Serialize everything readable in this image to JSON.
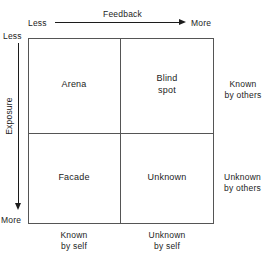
{
  "diagram": {
    "type": "johari-window",
    "grid": {
      "rows": 2,
      "columns": 2
    },
    "quadrants": [
      {
        "id": "arena",
        "label_line1": "Arena",
        "label_line2": "",
        "row": "top",
        "column": "left"
      },
      {
        "id": "blind-spot",
        "label_line1": "Blind",
        "label_line2": "spot",
        "row": "top",
        "column": "right"
      },
      {
        "id": "facade",
        "label_line1": "Facade",
        "label_line2": "",
        "row": "bottom",
        "column": "left"
      },
      {
        "id": "unknown",
        "label_line1": "Unknown",
        "label_line2": "",
        "row": "bottom",
        "column": "right"
      }
    ],
    "horizontal_axis": {
      "title": "Feedback",
      "start_label": "Less",
      "end_label": "More",
      "direction": "left-to-right"
    },
    "vertical_axis": {
      "title": "Exposure",
      "start_label": "Less",
      "end_label": "More",
      "direction": "top-to-bottom"
    },
    "row_labels": [
      {
        "id": "known-by-others",
        "line1": "Known",
        "line2": "by others"
      },
      {
        "id": "unknown-by-others",
        "line1": "Unknown",
        "line2": "by others"
      }
    ],
    "column_labels": [
      {
        "id": "known-by-self",
        "line1": "Known",
        "line2": "by self"
      },
      {
        "id": "unknown-by-self",
        "line1": "Unknown",
        "line2": "by self"
      }
    ],
    "colors": {
      "background": "#ffffff",
      "line": "#555555",
      "axis": "#1c1c1c",
      "text": "#1c1c1c"
    }
  }
}
